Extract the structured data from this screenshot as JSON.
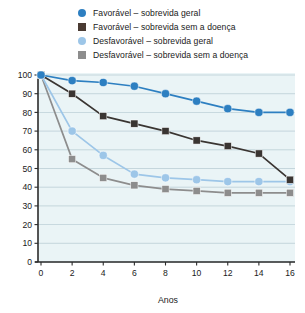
{
  "chart_data": {
    "type": "line",
    "title": "",
    "xlabel": "Anos",
    "ylabel": "",
    "x": [
      0,
      2,
      4,
      6,
      8,
      10,
      12,
      14,
      16
    ],
    "xticks": [
      "0",
      "2",
      "4",
      "6",
      "8",
      "10",
      "12",
      "14",
      "16"
    ],
    "yticks": [
      "0",
      "10",
      "20",
      "30",
      "40",
      "50",
      "60",
      "70",
      "80",
      "90",
      "100"
    ],
    "xlim": [
      0,
      16
    ],
    "ylim": [
      0,
      100
    ],
    "grid": true,
    "legend_position": "top",
    "series": [
      {
        "name": "Favorável – sobrevida geral",
        "color": "#2d7fc1",
        "marker": "circle",
        "values": [
          100,
          97,
          96,
          94,
          90,
          86,
          82,
          80,
          80
        ]
      },
      {
        "name": "Favorável – sobrevida sem a doença",
        "color": "#3a3532",
        "marker": "square",
        "values": [
          100,
          90,
          78,
          74,
          70,
          65,
          62,
          58,
          44
        ]
      },
      {
        "name": "Desfavorável – sobrevida geral",
        "color": "#9dc6e8",
        "marker": "circle",
        "values": [
          100,
          70,
          57,
          47,
          45,
          44,
          43,
          43,
          43
        ]
      },
      {
        "name": "Desfavorável – sobrevida sem a doença",
        "color": "#8d8d8d",
        "marker": "square",
        "values": [
          100,
          55,
          45,
          41,
          39,
          38,
          37,
          37,
          37
        ]
      }
    ]
  },
  "legend": {
    "items": [
      {
        "label": "Favorável – sobrevida geral",
        "marker": "circle",
        "color": "#2d7fc1"
      },
      {
        "label": "Favorável – sobrevida sem a doença",
        "marker": "square",
        "color": "#4a3b33"
      },
      {
        "label": "Desfavorável – sobrevida geral",
        "marker": "circle",
        "color": "#9dc6e8"
      },
      {
        "label": "Desfavorável – sobrevida sem a doença",
        "marker": "square",
        "color": "#8d8d8d"
      }
    ]
  },
  "axes": {
    "x_title": "Anos",
    "plot_background": "#eaf4f6",
    "grid_color": "#8aa8b5",
    "axis_color": "#2b2b2b"
  }
}
